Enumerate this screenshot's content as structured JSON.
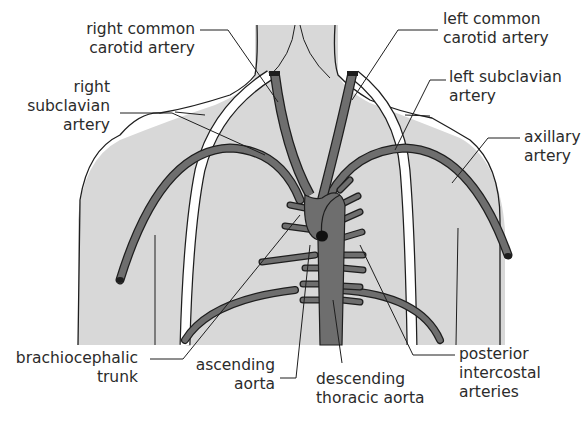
{
  "diagram": {
    "colors": {
      "body_fill": "#d8d8d8",
      "artery_fill": "#6e6e6e",
      "outline": "#1e1e1e",
      "vein_fill": "#ffffff",
      "background": "#ffffff",
      "text": "#2b2b2b"
    },
    "labels": {
      "right_common_carotid": [
        "right common",
        "carotid artery"
      ],
      "left_common_carotid": [
        "left common",
        "carotid artery"
      ],
      "right_subclavian": [
        "right",
        "subclavian",
        "artery"
      ],
      "left_subclavian": [
        "left subclavian",
        "artery"
      ],
      "axillary": [
        "axillary",
        "artery"
      ],
      "brachiocephalic": [
        "brachiocephalic",
        "trunk"
      ],
      "ascending_aorta": [
        "ascending",
        "aorta"
      ],
      "descending_aorta": [
        "descending",
        "thoracic aorta"
      ],
      "posterior_intercostal": [
        "posterior",
        "intercostal",
        "arteries"
      ]
    }
  }
}
